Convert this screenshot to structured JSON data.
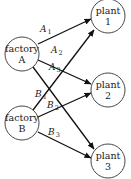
{
  "diagram": {
    "nodes": {
      "factory_a": {
        "line1": "factory",
        "line2": "A"
      },
      "factory_b": {
        "line1": "factory",
        "line2": "B"
      },
      "plant_1": {
        "line1": "plant",
        "line2": "1"
      },
      "plant_2": {
        "line1": "plant",
        "line2": "2"
      },
      "plant_3": {
        "line1": "plant",
        "line2": "3"
      }
    },
    "edges": {
      "a1": {
        "letter": "A",
        "sub": "1",
        "from": "factory A",
        "to": "plant 1"
      },
      "a2": {
        "letter": "A",
        "sub": "2",
        "from": "factory A",
        "to": "plant 2"
      },
      "a3": {
        "letter": "A",
        "sub": "3",
        "from": "factory A",
        "to": "plant 3"
      },
      "b1": {
        "letter": "B",
        "sub": "1",
        "from": "factory B",
        "to": "plant 1"
      },
      "b2": {
        "letter": "B",
        "sub": "2",
        "from": "factory B",
        "to": "plant 2"
      },
      "b3": {
        "letter": "B",
        "sub": "3",
        "from": "factory B",
        "to": "plant 3"
      }
    },
    "colors": {
      "stroke": "#111111",
      "circle_stroke": "#333333",
      "background": "#ffffff"
    }
  }
}
